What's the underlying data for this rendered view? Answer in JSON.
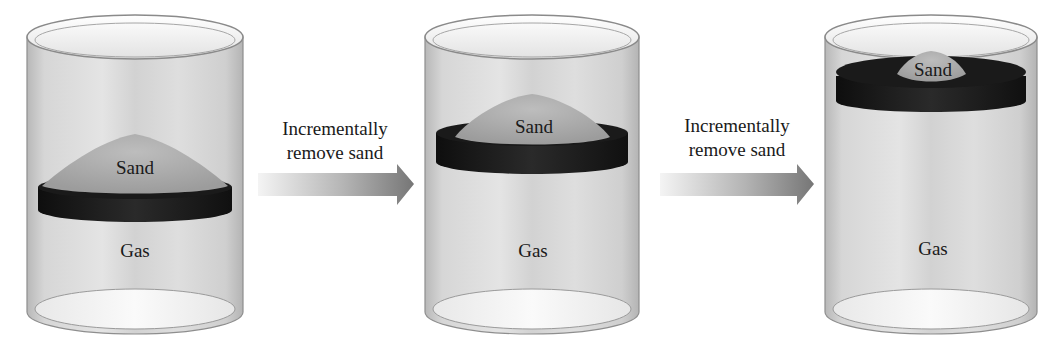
{
  "diagram": {
    "stages": [
      {
        "id": 1,
        "sand_label": "Sand",
        "gas_label": "Gas"
      },
      {
        "id": 2,
        "sand_label": "Sand",
        "gas_label": "Gas"
      },
      {
        "id": 3,
        "sand_label": "Sand",
        "gas_label": "Gas"
      }
    ],
    "transitions": [
      {
        "line1": "Incrementally",
        "line2": "remove sand"
      },
      {
        "line1": "Incrementally",
        "line2": "remove sand"
      }
    ],
    "colors": {
      "glass": "#c9c9c9",
      "glass_edge": "#8c8c8c",
      "piston": "#1c1c1c",
      "sand": "#a8a8a8",
      "arrow_start": "#f2f2f2",
      "arrow_end": "#7a7a7a",
      "text": "#1a1a1a"
    }
  }
}
